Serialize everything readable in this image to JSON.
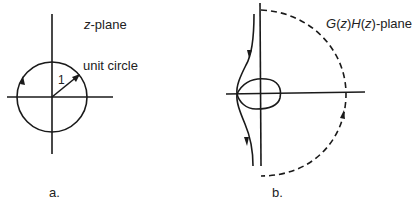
{
  "panel_a": {
    "plane_label_var": "z",
    "plane_label_rest": "-plane",
    "circle_label": "unit circle",
    "radius_label": "1",
    "caption": "a."
  },
  "panel_b": {
    "plane_label_g": "G",
    "plane_label_z1": "z",
    "plane_label_h": "H",
    "plane_label_z2": "z",
    "plane_label_rest": "-plane",
    "caption": "b."
  },
  "colors": {
    "line": "#1a1a1a",
    "background": "#ffffff"
  }
}
